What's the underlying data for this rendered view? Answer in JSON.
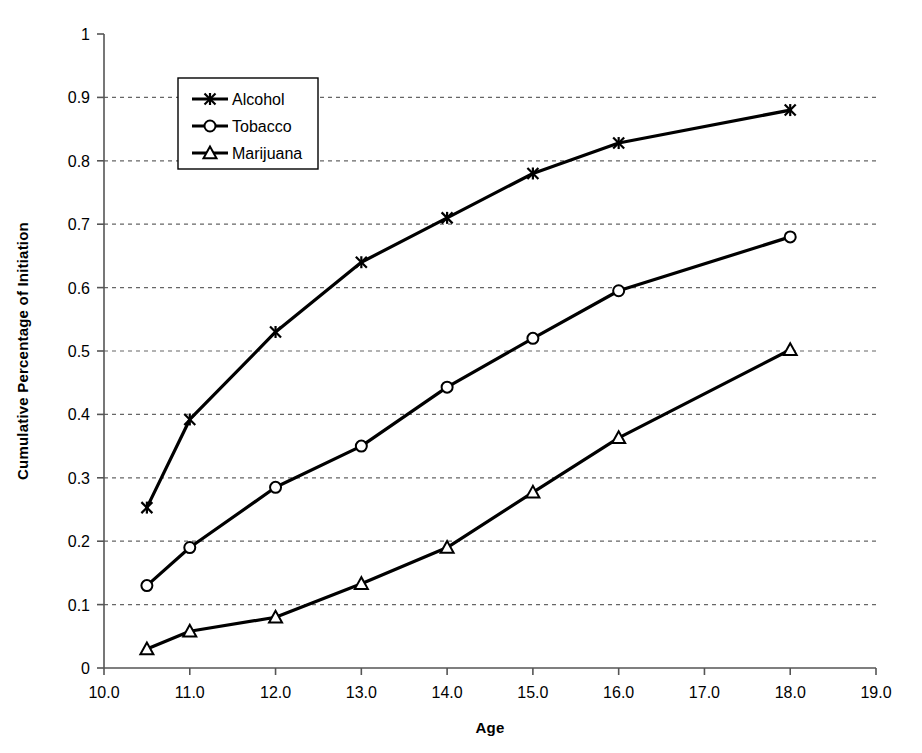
{
  "chart_data": {
    "type": "line",
    "title": "",
    "xlabel": "Age",
    "ylabel": "Cumulative Percentage of Initiation",
    "xlim": [
      10.0,
      19.0
    ],
    "ylim": [
      0,
      1
    ],
    "xticks": [
      "10.0",
      "11.0",
      "12.0",
      "13.0",
      "14.0",
      "15.0",
      "16.0",
      "17.0",
      "18.0",
      "19.0"
    ],
    "xtick_values": [
      10,
      11,
      12,
      13,
      14,
      15,
      16,
      17,
      18,
      19
    ],
    "yticks": [
      "0",
      "0.1",
      "0.2",
      "0.3",
      "0.4",
      "0.5",
      "0.6",
      "0.7",
      "0.8",
      "0.9",
      "1"
    ],
    "ytick_values": [
      0,
      0.1,
      0.2,
      0.3,
      0.4,
      0.5,
      0.6,
      0.7,
      0.8,
      0.9,
      1
    ],
    "grid": "horizontal-dashed",
    "legend_position": "upper-left-inside",
    "x": [
      10.5,
      11,
      12,
      13,
      14,
      15,
      16,
      18
    ],
    "series": [
      {
        "name": "Alcohol",
        "marker": "x-cross",
        "values": [
          0.253,
          0.392,
          0.53,
          0.64,
          0.71,
          0.78,
          0.828,
          0.88
        ]
      },
      {
        "name": "Tobacco",
        "marker": "circle",
        "values": [
          0.13,
          0.19,
          0.285,
          0.35,
          0.443,
          0.52,
          0.595,
          0.68
        ]
      },
      {
        "name": "Marijuana",
        "marker": "triangle",
        "values": [
          0.03,
          0.058,
          0.08,
          0.133,
          0.19,
          0.277,
          0.363,
          0.502
        ]
      }
    ],
    "colors": {
      "line": "#000000",
      "grid": "#666666",
      "axis": "#555555",
      "background": "#ffffff"
    }
  }
}
